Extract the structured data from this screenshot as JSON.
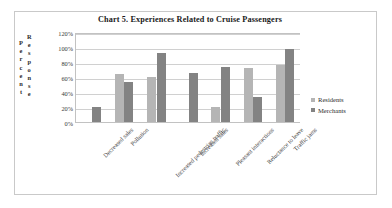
{
  "chart_data": {
    "type": "bar",
    "title": "Chart 5. Experiences  Related to Cruise  Passengers",
    "xlabel": "",
    "ylabel": "Percent Response",
    "ylabel_columns": [
      "Percent",
      "Response"
    ],
    "ylim": [
      0,
      120
    ],
    "ytick_labels": [
      "120%",
      "100%",
      "80%",
      "60%",
      "40%",
      "20%",
      "0%"
    ],
    "ytick_values": [
      120,
      100,
      80,
      60,
      40,
      20,
      0
    ],
    "grid": true,
    "legend_position": "right",
    "categories": [
      "Decreased sales",
      "Pollution",
      "Increased pedestrian traffic",
      "Increased sales",
      "Pleasant interactions",
      "Reluctance to leave",
      "Traffic jams"
    ],
    "series": [
      {
        "name": "Residents",
        "color": "#b5b5b5",
        "values": [
          0,
          64,
          60,
          0,
          20,
          72,
          76
        ]
      },
      {
        "name": "Merchants",
        "color": "#838383",
        "values": [
          20,
          54,
          92,
          65,
          74,
          33,
          97
        ]
      }
    ]
  },
  "legend": {
    "items": [
      {
        "label": "Residents",
        "color": "#b5b5b5"
      },
      {
        "label": "Merchants",
        "color": "#838383"
      }
    ]
  }
}
